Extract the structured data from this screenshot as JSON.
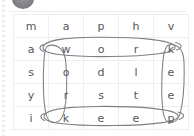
{
  "page": {
    "background_color": "#ffffff",
    "grid_line_color": "#eeeef0",
    "letter_color": "#55565a",
    "ink_color": "#6d6e72"
  },
  "decor": {
    "avatar_label": "avatar-blob",
    "left_rail_label": "left-rail"
  },
  "puzzle": {
    "type": "word-search",
    "rows": 5,
    "cols": 5,
    "grid": [
      [
        "m",
        "a",
        "p",
        "h",
        "v"
      ],
      [
        "a",
        "w",
        "o",
        "r",
        "k"
      ],
      [
        "s",
        "o",
        "d",
        "l",
        "e"
      ],
      [
        "y",
        "r",
        "s",
        "t",
        "e"
      ],
      [
        "i",
        "k",
        "e",
        "e",
        "p"
      ]
    ],
    "circled_words": [
      {
        "word": "work",
        "orientation": "horizontal",
        "row": 2,
        "start_col": 2,
        "end_col": 5,
        "letters": [
          "w",
          "o",
          "r",
          "k"
        ]
      },
      {
        "word": "keep",
        "orientation": "horizontal",
        "row": 5,
        "start_col": 2,
        "end_col": 5,
        "letters": [
          "k",
          "e",
          "e",
          "p"
        ]
      },
      {
        "word": "work",
        "orientation": "vertical",
        "col": 2,
        "start_row": 2,
        "end_row": 5,
        "letters": [
          "w",
          "o",
          "r",
          "k"
        ]
      },
      {
        "word": "keep",
        "orientation": "vertical",
        "col": 5,
        "start_row": 2,
        "end_row": 5,
        "letters": [
          "k",
          "e",
          "e",
          "p"
        ]
      }
    ]
  }
}
